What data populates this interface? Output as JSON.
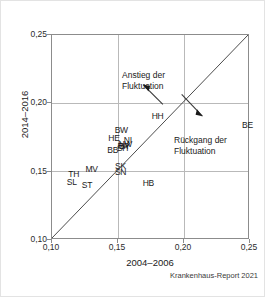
{
  "chart_data": {
    "type": "scatter",
    "title": "",
    "xlabel": "2004–2006",
    "ylabel": "2014–2016",
    "xlim": [
      0.1,
      0.25
    ],
    "ylim": [
      0.1,
      0.25
    ],
    "xticks": [
      "0,10",
      "0,15",
      "0,20",
      "0,25"
    ],
    "xtick_values": [
      0.1,
      0.15,
      0.2,
      0.25
    ],
    "yticks": [
      "0,10",
      "0,15",
      "0,20",
      "0,25"
    ],
    "ytick_values": [
      0.1,
      0.15,
      0.2,
      0.25
    ],
    "grid": true,
    "legend": "none",
    "reference_line": {
      "type": "identity",
      "from": [
        0.1,
        0.1
      ],
      "to": [
        0.25,
        0.25
      ]
    },
    "point_labels": [
      "BW",
      "HE",
      "NI",
      "NW",
      "BY",
      "RP",
      "SH",
      "BB",
      "SK",
      "SN",
      "HH",
      "BE",
      "HB",
      "MV",
      "TH",
      "SL",
      "ST"
    ],
    "points": [
      {
        "label": "BW",
        "x": 0.1525,
        "y": 0.1805
      },
      {
        "label": "HE",
        "x": 0.147,
        "y": 0.1745
      },
      {
        "label": "NI",
        "x": 0.1575,
        "y": 0.1735
      },
      {
        "label": "NW",
        "x": 0.1555,
        "y": 0.17
      },
      {
        "label": "BY",
        "x": 0.155,
        "y": 0.1685
      },
      {
        "label": "RP",
        "x": 0.154,
        "y": 0.169
      },
      {
        "label": "SH",
        "x": 0.1535,
        "y": 0.1675
      },
      {
        "label": "BB",
        "x": 0.146,
        "y": 0.166
      },
      {
        "label": "SK",
        "x": 0.152,
        "y": 0.1545
      },
      {
        "label": "SN",
        "x": 0.152,
        "y": 0.15
      },
      {
        "label": "HH",
        "x": 0.18,
        "y": 0.1905
      },
      {
        "label": "BE",
        "x": 0.248,
        "y": 0.1845
      },
      {
        "label": "HB",
        "x": 0.173,
        "y": 0.142
      },
      {
        "label": "MV",
        "x": 0.13,
        "y": 0.152
      },
      {
        "label": "TH",
        "x": 0.1165,
        "y": 0.148
      },
      {
        "label": "SL",
        "x": 0.115,
        "y": 0.1425
      },
      {
        "label": "ST",
        "x": 0.1265,
        "y": 0.14
      }
    ],
    "annotations": [
      {
        "name": "increase",
        "line1": "Anstieg der",
        "line2": "Fluktuation",
        "arrow": "up-left"
      },
      {
        "name": "decrease",
        "line1": "Rückgang der",
        "line2": "Fluktuation",
        "arrow": "down-right"
      }
    ],
    "source": "Krankenhaus-Report 2021",
    "colors": {
      "axis": "#8c8c8c",
      "grid": "#b9b9b9",
      "text": "#1a1a1a",
      "line": "#4a4a4a",
      "background": "#ffffff",
      "border": "#e3e3e3"
    }
  }
}
